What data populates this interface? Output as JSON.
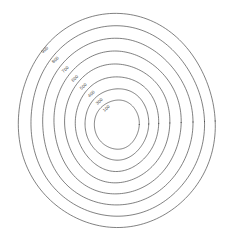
{
  "figure": {
    "title": "",
    "background": "#ffffff",
    "width": 232,
    "height": 239
  },
  "style": {
    "contour_stroke": "#4a4a4a",
    "contour_stroke_width": 0.7,
    "label_color": "#444444",
    "label_font_size": 4.4
  },
  "chart_data": {
    "type": "line",
    "plot_kind": "contour",
    "title": "",
    "subtitle": "",
    "xlabel": "",
    "ylabel": "",
    "grid": false,
    "legend": false,
    "legend_position": "none",
    "axes_visible": false,
    "ticks_visible": false,
    "xlim": [
      0,
      232
    ],
    "ylim": [
      0,
      239
    ],
    "center": {
      "x": 116.5,
      "y": 121.0
    },
    "contour_levels": [
      900,
      800,
      700,
      600,
      500,
      400,
      300,
      100
    ],
    "contour_count": 8,
    "label_texts": [
      "900",
      "800",
      "700",
      "600",
      "500",
      "400",
      "300",
      "100"
    ],
    "label_rotation_deg": -45,
    "series": [
      {
        "name": "900",
        "level": 900,
        "label": "900",
        "rx": 98.5,
        "ry": 107.0,
        "cx": 116.5,
        "cy": 121.0,
        "label_x": 45.0,
        "label_y": 50.0,
        "wobble": 1.5,
        "phase": 0.2
      },
      {
        "name": "800",
        "level": 800,
        "label": "800",
        "rx": 87.0,
        "ry": 95.0,
        "cx": 117.0,
        "cy": 121.5,
        "label_x": 55.5,
        "label_y": 60.0,
        "wobble": 1.4,
        "phase": 0.7
      },
      {
        "name": "700",
        "level": 700,
        "label": "700",
        "rx": 75.5,
        "ry": 83.0,
        "cx": 117.0,
        "cy": 122.0,
        "label_x": 65.5,
        "label_y": 69.5,
        "wobble": 1.3,
        "phase": 1.2
      },
      {
        "name": "600",
        "level": 600,
        "label": "600",
        "rx": 64.0,
        "ry": 71.0,
        "cx": 117.0,
        "cy": 122.5,
        "label_x": 75.0,
        "label_y": 78.5,
        "wobble": 1.2,
        "phase": 1.8
      },
      {
        "name": "500",
        "level": 500,
        "label": "500",
        "rx": 53.0,
        "ry": 59.0,
        "cx": 117.0,
        "cy": 123.0,
        "label_x": 83.5,
        "label_y": 86.5,
        "wobble": 1.1,
        "phase": 2.4
      },
      {
        "name": "400",
        "level": 400,
        "label": "400",
        "rx": 42.0,
        "ry": 47.0,
        "cx": 117.0,
        "cy": 123.5,
        "label_x": 91.5,
        "label_y": 94.0,
        "wobble": 1.0,
        "phase": 3.0
      },
      {
        "name": "300",
        "level": 300,
        "label": "300",
        "rx": 32.0,
        "ry": 35.5,
        "cx": 117.0,
        "cy": 124.0,
        "label_x": 99.5,
        "label_y": 101.5,
        "wobble": 0.8,
        "phase": 3.6
      },
      {
        "name": "100",
        "level": 100,
        "label": "100",
        "rx": 22.5,
        "ry": 24.5,
        "cx": 117.0,
        "cy": 124.5,
        "label_x": 106.5,
        "label_y": 108.5,
        "wobble": 0.6,
        "phase": 4.2
      }
    ]
  }
}
